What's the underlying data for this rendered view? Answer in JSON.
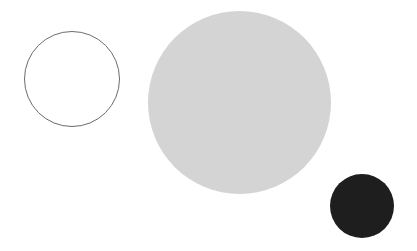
{
  "canvas": {
    "width": 417,
    "height": 251,
    "background": "#ffffff"
  },
  "shapes": [
    {
      "name": "outline-circle",
      "type": "circle",
      "left": 24,
      "top": 31,
      "diameter": 96,
      "fill": "#ffffff",
      "stroke": "#6b6b6b",
      "stroke_width": 1.5
    },
    {
      "name": "large-gray-circle",
      "type": "circle",
      "left": 148,
      "top": 11,
      "diameter": 183,
      "fill": "#d4d4d4",
      "stroke": "none"
    },
    {
      "name": "small-dark-circle",
      "type": "circle",
      "left": 330,
      "top": 174,
      "diameter": 64,
      "fill": "#1e1e1e",
      "stroke": "none"
    }
  ]
}
